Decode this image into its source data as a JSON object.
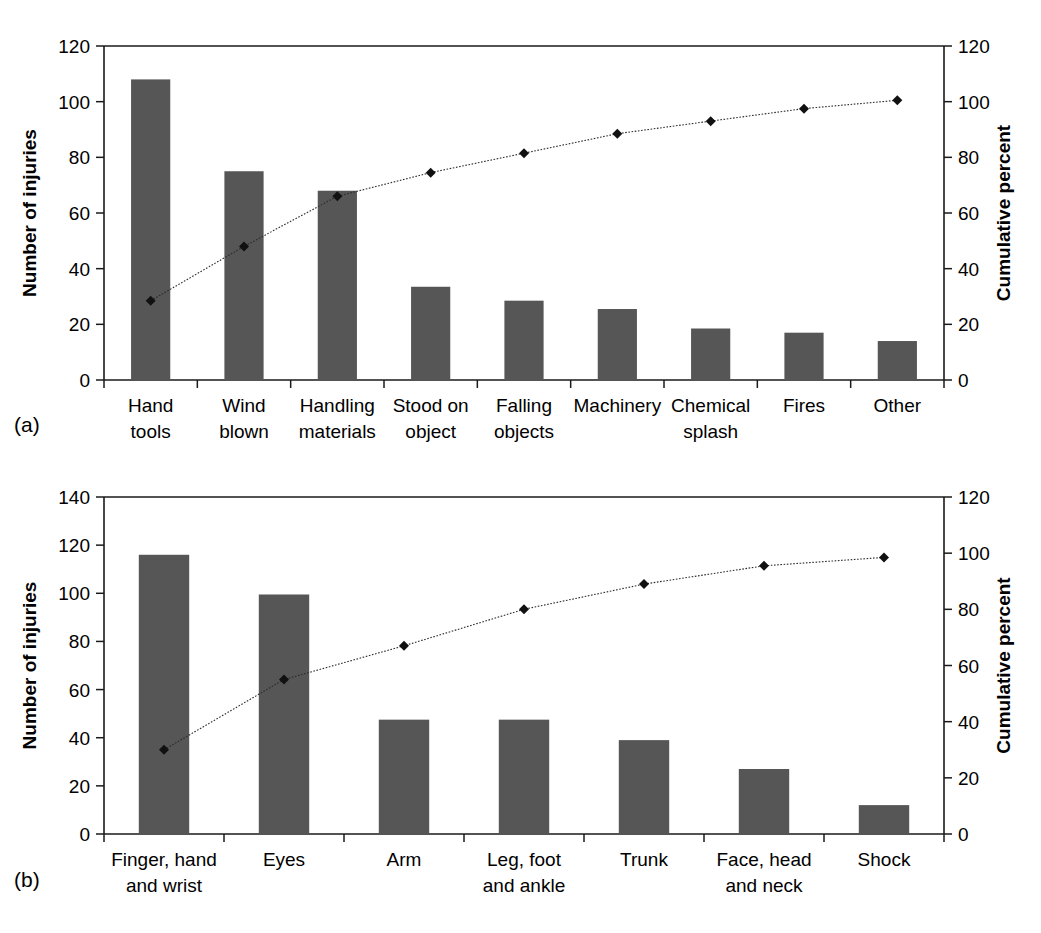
{
  "figure": {
    "panel_a_label": "(a)",
    "panel_b_label": "(b)"
  },
  "chart_data": [
    {
      "id": "a",
      "type": "bar",
      "title": "",
      "panel_label": "(a)",
      "xlabel": "",
      "ylabel": "Number of injuries",
      "y2label": "Cumulative percent",
      "ylim": [
        0,
        120
      ],
      "y2lim": [
        0,
        120
      ],
      "yticks": [
        0,
        20,
        40,
        60,
        80,
        100,
        120
      ],
      "y2ticks": [
        0,
        20,
        40,
        60,
        80,
        100,
        120
      ],
      "grid": false,
      "legend": "none",
      "categories": [
        "Hand tools",
        "Wind blown",
        "Handling materials",
        "Stood on object",
        "Falling objects",
        "Machinery",
        "Chemical splash",
        "Fires",
        "Other"
      ],
      "category_lines": [
        [
          "Hand",
          "tools"
        ],
        [
          "Wind",
          "blown"
        ],
        [
          "Handling",
          "materials"
        ],
        [
          "Stood on",
          "object"
        ],
        [
          "Falling",
          "objects"
        ],
        [
          "Machinery",
          ""
        ],
        [
          "Chemical",
          "splash"
        ],
        [
          "Fires",
          ""
        ],
        [
          "Other",
          ""
        ]
      ],
      "series": [
        {
          "name": "Number of injuries",
          "axis": "left",
          "kind": "bar",
          "values": [
            108,
            75,
            68,
            33.5,
            28.5,
            25.5,
            18.5,
            17,
            14
          ]
        },
        {
          "name": "Cumulative percent",
          "axis": "right",
          "kind": "line",
          "values": [
            28.5,
            48,
            66,
            74.5,
            81.5,
            88.5,
            93,
            97.5,
            100.5
          ]
        }
      ]
    },
    {
      "id": "b",
      "type": "bar",
      "title": "",
      "panel_label": "(b)",
      "xlabel": "",
      "ylabel": "Number of injuries",
      "y2label": "Cumulative percent",
      "ylim": [
        0,
        140
      ],
      "y2lim": [
        0,
        120
      ],
      "yticks": [
        0,
        20,
        40,
        60,
        80,
        100,
        120,
        140
      ],
      "y2ticks": [
        0,
        20,
        40,
        60,
        80,
        100,
        120
      ],
      "grid": false,
      "legend": "none",
      "categories": [
        "Finger, hand and wrist",
        "Eyes",
        "Arm",
        "Leg, foot and ankle",
        "Trunk",
        "Face, head and neck",
        "Shock"
      ],
      "category_lines": [
        [
          "Finger, hand",
          "and wrist"
        ],
        [
          "Eyes",
          ""
        ],
        [
          "Arm",
          ""
        ],
        [
          "Leg, foot",
          "and ankle"
        ],
        [
          "Trunk",
          ""
        ],
        [
          "Face, head",
          "and neck"
        ],
        [
          "Shock",
          ""
        ]
      ],
      "series": [
        {
          "name": "Number of injuries",
          "axis": "left",
          "kind": "bar",
          "values": [
            116,
            99.5,
            47.5,
            47.5,
            39,
            27,
            12
          ]
        },
        {
          "name": "Cumulative percent",
          "axis": "right",
          "kind": "line",
          "values": [
            30,
            55,
            67,
            80,
            89,
            95.5,
            98.5
          ]
        }
      ]
    }
  ]
}
